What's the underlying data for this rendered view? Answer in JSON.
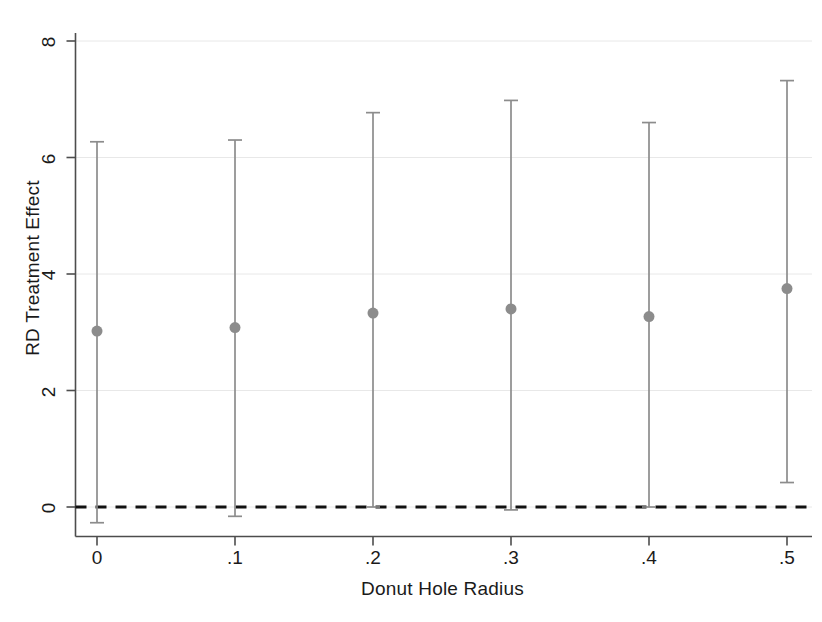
{
  "chart_data": {
    "type": "scatter",
    "title": "",
    "subtitle": "",
    "xlabel": "Donut Hole Radius",
    "ylabel": "RD Treatment Effect",
    "x": [
      0,
      0.1,
      0.2,
      0.3,
      0.4,
      0.5
    ],
    "xtick_labels": [
      "0",
      ".1",
      ".2",
      ".3",
      ".4",
      ".5"
    ],
    "ytick_labels": [
      "0",
      "2",
      "4",
      "6",
      "8"
    ],
    "ytick_values": [
      0,
      2,
      4,
      6,
      8
    ],
    "values": [
      3.02,
      3.08,
      3.33,
      3.4,
      3.27,
      3.75
    ],
    "ci_low": [
      -0.27,
      -0.16,
      0.0,
      -0.05,
      0.0,
      0.42
    ],
    "ci_high": [
      6.27,
      6.3,
      6.77,
      6.98,
      6.6,
      7.32
    ],
    "xlim": [
      -0.035,
      0.535
    ],
    "ylim": [
      -0.5,
      8.5
    ],
    "grid": true,
    "grid_axis": "y",
    "legend": "none",
    "reference_line": {
      "y": 0,
      "style": "dashed",
      "color": "#111111"
    },
    "marker": {
      "shape": "circle",
      "color": "#8c8c8c",
      "size": 11
    },
    "errorbar": {
      "color": "#8c8c8c",
      "cap_width": 14
    },
    "series_name": "RD Treatment Effect"
  },
  "colors": {
    "axis": "#4d4d4d",
    "grid": "#e8e8e8",
    "marker": "#8c8c8c",
    "errorbar": "#8c8c8c",
    "zero_line": "#111111",
    "text": "#1a1a1a",
    "background": "#ffffff"
  }
}
